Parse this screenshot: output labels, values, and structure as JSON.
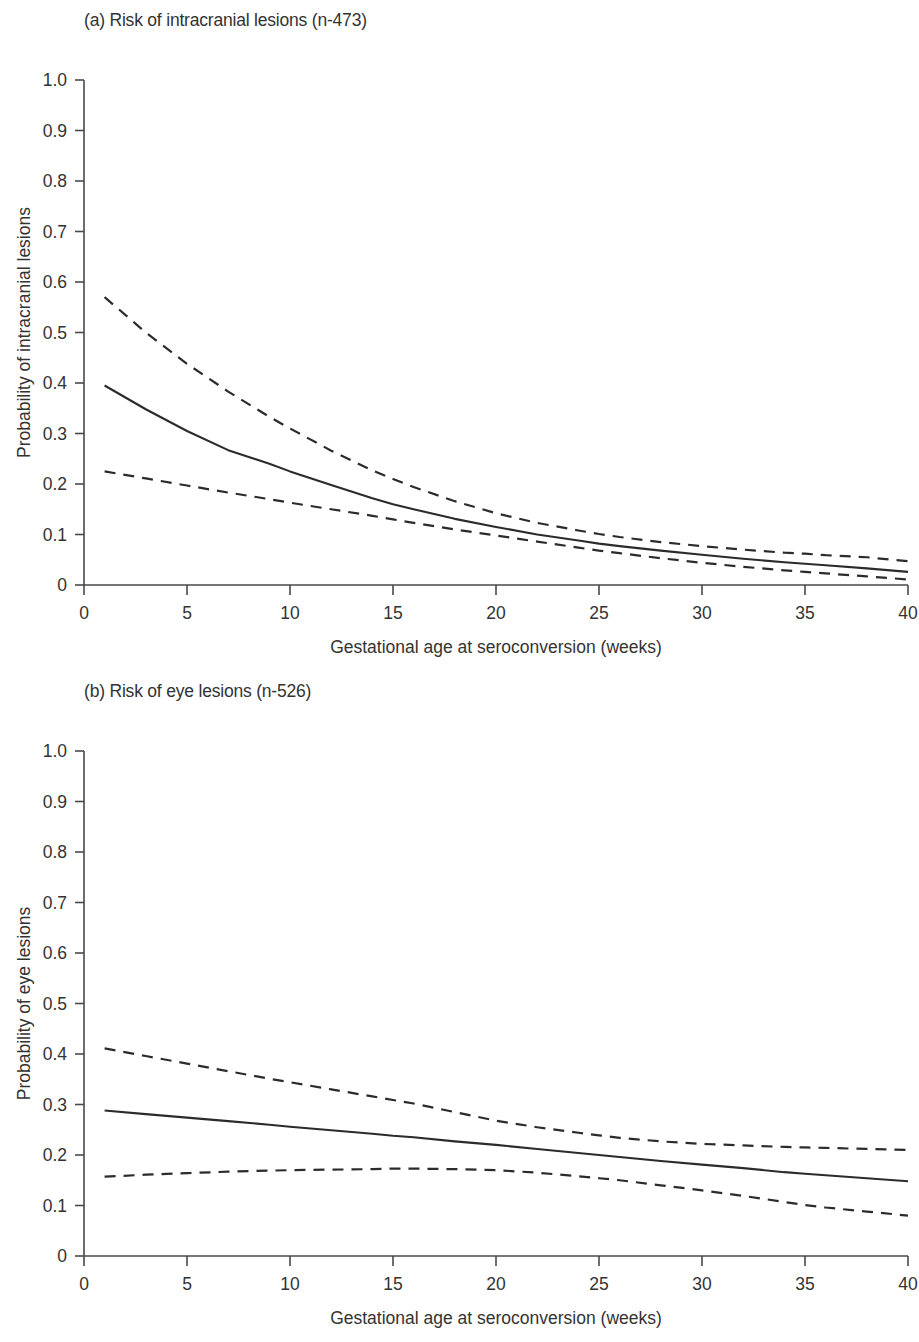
{
  "figure": {
    "background": "#ffffff",
    "line_color": "#2b2b2b",
    "axis_color": "#4a4a4a"
  },
  "panels": [
    {
      "id": "a",
      "title": "(a) Risk of intracranial lesions (n-473)",
      "ylabel": "Probability of intracranial lesions",
      "xlabel": "Gestational age at seroconversion (weeks)"
    },
    {
      "id": "b",
      "title": "(b) Risk of eye lesions (n-526)",
      "ylabel": "Probability of eye lesions",
      "xlabel": "Gestational age at seroconversion (weeks)"
    }
  ],
  "ticks": {
    "y": [
      "1.0",
      "0.9",
      "0.8",
      "0.7",
      "0.6",
      "0.5",
      "0.4",
      "0.3",
      "0.2",
      "0.1",
      "0"
    ],
    "x": [
      "0",
      "5",
      "10",
      "15",
      "20",
      "25",
      "30",
      "35",
      "40"
    ]
  },
  "chart_data": [
    {
      "type": "line",
      "panel": "a",
      "title": "(a) Risk of intracranial lesions (n-473)",
      "xlabel": "Gestational age at seroconversion (weeks)",
      "ylabel": "Probability of intracranial lesions",
      "xlim": [
        0,
        40
      ],
      "ylim": [
        0,
        1.0
      ],
      "xticks": [
        0,
        5,
        10,
        15,
        20,
        25,
        30,
        35,
        40
      ],
      "yticks": [
        0,
        0.1,
        0.2,
        0.3,
        0.4,
        0.5,
        0.6,
        0.7,
        0.8,
        0.9,
        1.0
      ],
      "grid": false,
      "legend": "none",
      "x": [
        1,
        3,
        5,
        7,
        9,
        10,
        12,
        14,
        15,
        16,
        18,
        20,
        22,
        24,
        25,
        26,
        28,
        30,
        32,
        34,
        35,
        36,
        38,
        40
      ],
      "series": [
        {
          "name": "Upper 95% confidence limit",
          "style": "dashed",
          "values": [
            0.57,
            0.5,
            0.438,
            0.383,
            0.333,
            0.31,
            0.266,
            0.227,
            0.21,
            0.194,
            0.166,
            0.142,
            0.123,
            0.108,
            0.101,
            0.095,
            0.085,
            0.077,
            0.07,
            0.064,
            0.062,
            0.059,
            0.055,
            0.047
          ]
        },
        {
          "name": "Predicted probability",
          "style": "solid",
          "values": [
            0.395,
            0.348,
            0.305,
            0.267,
            0.24,
            0.225,
            0.198,
            0.172,
            0.16,
            0.15,
            0.131,
            0.115,
            0.1,
            0.088,
            0.082,
            0.077,
            0.068,
            0.06,
            0.052,
            0.045,
            0.042,
            0.039,
            0.033,
            0.026
          ]
        },
        {
          "name": "Lower 95% confidence limit",
          "style": "dashed",
          "values": [
            0.225,
            0.211,
            0.197,
            0.183,
            0.17,
            0.163,
            0.15,
            0.137,
            0.13,
            0.123,
            0.11,
            0.098,
            0.086,
            0.074,
            0.068,
            0.063,
            0.053,
            0.044,
            0.036,
            0.029,
            0.026,
            0.023,
            0.017,
            0.011
          ]
        }
      ]
    },
    {
      "type": "line",
      "panel": "b",
      "title": "(b) Risk of eye lesions (n-526)",
      "xlabel": "Gestational age at seroconversion (weeks)",
      "ylabel": "Probability of eye lesions",
      "xlim": [
        0,
        40
      ],
      "ylim": [
        0,
        1.0
      ],
      "xticks": [
        0,
        5,
        10,
        15,
        20,
        25,
        30,
        35,
        40
      ],
      "yticks": [
        0,
        0.1,
        0.2,
        0.3,
        0.4,
        0.5,
        0.6,
        0.7,
        0.8,
        0.9,
        1.0
      ],
      "grid": false,
      "legend": "none",
      "x": [
        1,
        3,
        5,
        7,
        9,
        10,
        12,
        14,
        15,
        16,
        18,
        20,
        22,
        24,
        25,
        26,
        28,
        30,
        32,
        34,
        35,
        36,
        38,
        40
      ],
      "series": [
        {
          "name": "Upper 95% confidence limit",
          "style": "dashed",
          "values": [
            0.411,
            0.396,
            0.381,
            0.366,
            0.351,
            0.344,
            0.33,
            0.316,
            0.309,
            0.302,
            0.285,
            0.268,
            0.255,
            0.244,
            0.239,
            0.234,
            0.227,
            0.222,
            0.219,
            0.216,
            0.215,
            0.214,
            0.212,
            0.21
          ]
        },
        {
          "name": "Predicted probability",
          "style": "solid",
          "values": [
            0.288,
            0.281,
            0.274,
            0.267,
            0.26,
            0.256,
            0.249,
            0.242,
            0.238,
            0.235,
            0.227,
            0.22,
            0.212,
            0.204,
            0.2,
            0.196,
            0.188,
            0.181,
            0.174,
            0.166,
            0.163,
            0.16,
            0.154,
            0.148
          ]
        },
        {
          "name": "Lower 95% confidence limit",
          "style": "dashed",
          "values": [
            0.157,
            0.161,
            0.164,
            0.167,
            0.169,
            0.17,
            0.171,
            0.172,
            0.173,
            0.173,
            0.172,
            0.17,
            0.165,
            0.158,
            0.154,
            0.15,
            0.14,
            0.13,
            0.119,
            0.107,
            0.101,
            0.096,
            0.088,
            0.08
          ]
        }
      ]
    }
  ]
}
